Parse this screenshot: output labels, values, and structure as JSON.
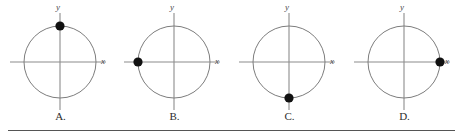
{
  "figure": {
    "type": "unit-circle-multiple-choice",
    "background_color": "#ffffff",
    "axis_color": "#8c8c8c",
    "circle_color": "#7d7d7d",
    "point_color": "#111111",
    "label_color": "#2e2e2e",
    "rule_color": "#555555",
    "axis_labels": {
      "x": "x",
      "y": "y"
    },
    "options": [
      {
        "label": "A.",
        "letter": "A",
        "point_angle_deg": 90,
        "point_coordinates": [
          0,
          1
        ],
        "point_position": "top",
        "cx": 58,
        "cy": 62,
        "r": 36,
        "point_x": 58,
        "point_y": 26
      },
      {
        "label": "B.",
        "letter": "B",
        "point_angle_deg": 180,
        "point_coordinates": [
          -1,
          0
        ],
        "point_position": "left",
        "cx": 58,
        "cy": 62,
        "r": 36,
        "point_x": 22,
        "point_y": 62
      },
      {
        "label": "C.",
        "letter": "C",
        "point_angle_deg": 270,
        "point_coordinates": [
          0,
          -1
        ],
        "point_position": "bottom",
        "cx": 58,
        "cy": 62,
        "r": 36,
        "point_x": 58,
        "point_y": 98
      },
      {
        "label": "D.",
        "letter": "D",
        "point_angle_deg": 0,
        "point_coordinates": [
          1,
          0
        ],
        "point_position": "right",
        "cx": 58,
        "cy": 62,
        "r": 36,
        "point_x": 94,
        "point_y": 62
      }
    ]
  }
}
